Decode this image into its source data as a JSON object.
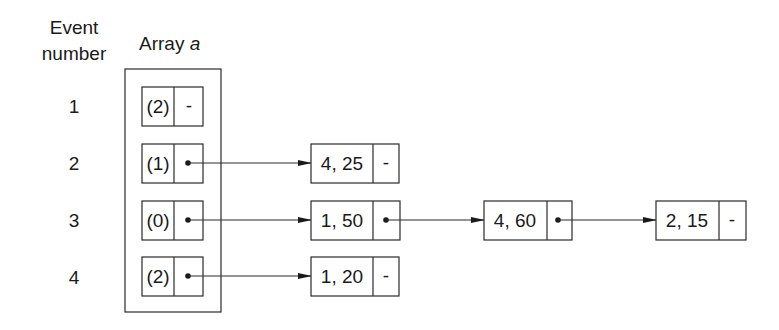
{
  "headers": {
    "event_line1": "Event",
    "event_line2": "number",
    "array_label": "Array ",
    "array_var": "a"
  },
  "events": [
    {
      "number": "1",
      "array_count": "(2)",
      "pointer": "-",
      "chain": []
    },
    {
      "number": "2",
      "array_count": "(1)",
      "pointer": "•",
      "chain": [
        {
          "value": "4, 25",
          "next": "-"
        }
      ]
    },
    {
      "number": "3",
      "array_count": "(0)",
      "pointer": "•",
      "chain": [
        {
          "value": "1, 50",
          "next": "•"
        },
        {
          "value": "4, 60",
          "next": "•"
        },
        {
          "value": "2, 15",
          "next": "-"
        }
      ]
    },
    {
      "number": "4",
      "array_count": "(2)",
      "pointer": "•",
      "chain": [
        {
          "value": "1, 20",
          "next": "-"
        }
      ]
    }
  ],
  "colors": {
    "ink": "#1a1a1a",
    "background": "#ffffff"
  }
}
